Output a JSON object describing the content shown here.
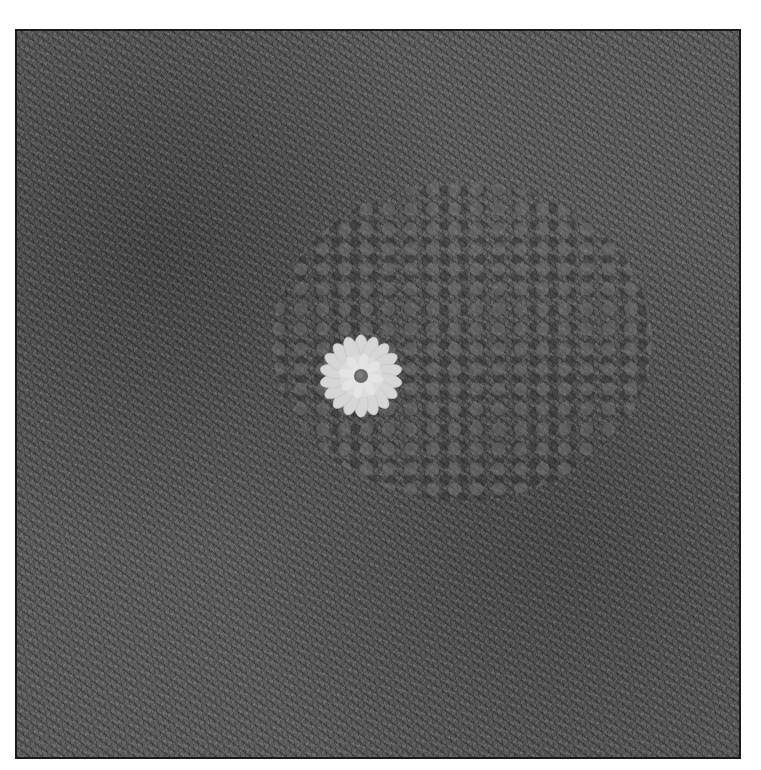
{
  "image": {
    "description": "Grayscale photograph of a single white daisy-like flower lying on grass and clover, enclosed in a thin dark border",
    "subject": "daisy flower",
    "background": "grass and clover patch",
    "colors": {
      "border": "#1a1a1a",
      "grass": "#5c5c5c",
      "petals": "#d9d9d9",
      "flower_center": "#6a6a6a",
      "page_background": "#ffffff"
    }
  }
}
